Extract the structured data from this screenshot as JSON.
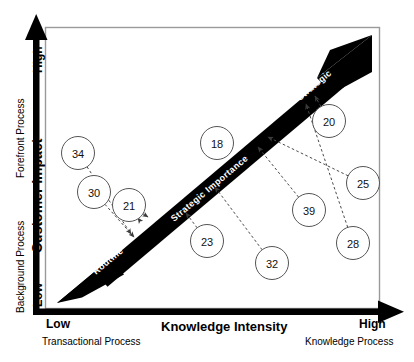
{
  "figure": {
    "type": "strategic-positioning-matrix",
    "background": "#ffffff",
    "band_color": "#000000",
    "node_stroke": "#555555"
  },
  "axes": {
    "x": {
      "title": "Knowledge Intensity",
      "low_label": "Low",
      "high_label": "High",
      "low_sub": "Transactional Process",
      "high_sub": "Knowledge Process"
    },
    "y": {
      "title": "Customer Impact",
      "low_label": "Low",
      "high_label": "High",
      "low_sub": "Background  Process",
      "high_sub": "Forefront  Process"
    }
  },
  "diagonal": {
    "start_label": "Routine",
    "middle_label": "Strategic Importance",
    "end_label": "Strategic"
  },
  "nodes": [
    {
      "id": "34",
      "x": 78,
      "y": 153
    },
    {
      "id": "30",
      "x": 94,
      "y": 192
    },
    {
      "id": "21",
      "x": 129,
      "y": 205
    },
    {
      "id": "18",
      "x": 217,
      "y": 143
    },
    {
      "id": "23",
      "x": 207,
      "y": 241
    },
    {
      "id": "20",
      "x": 329,
      "y": 121
    },
    {
      "id": "25",
      "x": 363,
      "y": 183
    },
    {
      "id": "39",
      "x": 309,
      "y": 210
    },
    {
      "id": "28",
      "x": 353,
      "y": 243
    },
    {
      "id": "32",
      "x": 272,
      "y": 263
    }
  ],
  "connections": [
    {
      "from": "34",
      "to_x": 131,
      "to_y": 234
    },
    {
      "from": "30",
      "to_x": 134,
      "to_y": 237
    },
    {
      "from": "21",
      "to_x": 138,
      "to_y": 218
    },
    {
      "from": "21",
      "to_x": 148,
      "to_y": 217
    },
    {
      "from": "23",
      "to_x": 186,
      "to_y": 213
    },
    {
      "from": "32",
      "to_x": 215,
      "to_y": 187
    },
    {
      "from": "39",
      "to_x": 258,
      "to_y": 147
    },
    {
      "from": "25",
      "to_x": 268,
      "to_y": 137
    },
    {
      "from": "28",
      "to_x": 306,
      "to_y": 104
    },
    {
      "from": "20",
      "to_x": 315,
      "to_y": 96
    }
  ],
  "chart_data": {
    "type": "scatter",
    "title": "",
    "xlabel": "Knowledge Intensity",
    "ylabel": "Customer Impact",
    "xlim": [
      "Low",
      "High"
    ],
    "ylim": [
      "Low",
      "High"
    ],
    "grid": false,
    "legend": "none",
    "categories": [
      "34",
      "30",
      "21",
      "18",
      "23",
      "20",
      "25",
      "39",
      "28",
      "32"
    ],
    "annotations": [
      "Routine",
      "Strategic Importance",
      "Strategic",
      "Transactional Process",
      "Knowledge Process",
      "Background  Process",
      "Forefront  Process"
    ]
  }
}
